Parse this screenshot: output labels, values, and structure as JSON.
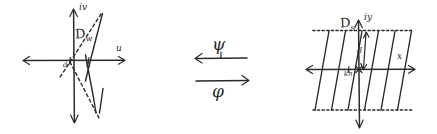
{
  "figure": {
    "ink_color": "#2a2a2a",
    "background_color": "#ffffff",
    "width": 437,
    "height": 134
  },
  "left_panel": {
    "domain_label": "D",
    "domain_subscript": "w",
    "horizontal_axis_label": "u",
    "vertical_axis_label": "iv",
    "tick_label_left": "d",
    "tick_label_right": "h",
    "description": "w-plane with two axes, a dashed slanted line and solid slanted lines through the origin region"
  },
  "middle_panel": {
    "upper_map_label": "ψ",
    "lower_map_label": "φ",
    "upper_arrow_direction": "left",
    "lower_arrow_direction": "right"
  },
  "right_panel": {
    "domain_label": "D",
    "domain_subscript": "s",
    "horizontal_axis_label": "x",
    "vertical_axis_label": "iy",
    "tick_label": "kh",
    "dimension_label": "d",
    "strip_line_count": 6,
    "description": "s-plane strip bounded by two dotted horizontal lines containing equally spaced slanted parallel lines"
  }
}
